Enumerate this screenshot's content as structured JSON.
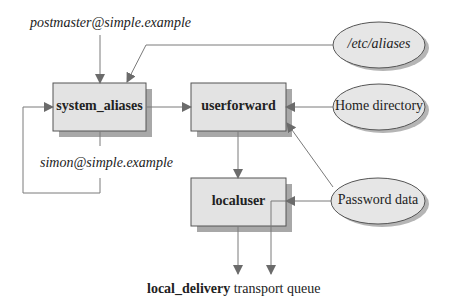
{
  "diagram": {
    "colors": {
      "box_fill": "#e3e3e3",
      "shadow": "#a8a8a8",
      "stroke": "#555555",
      "arrow": "#6b6b6b",
      "line": "#7a7a7a"
    },
    "inputs": {
      "postmaster": "postmaster@simple.example",
      "simon": "simon@simple.example"
    },
    "routers": [
      {
        "id": "system_aliases",
        "label": "system_aliases"
      },
      {
        "id": "userforward",
        "label": "userforward"
      },
      {
        "id": "localuser",
        "label": "localuser"
      }
    ],
    "data_sources": [
      {
        "id": "etc_aliases",
        "label": "/etc/aliases",
        "italic": true
      },
      {
        "id": "home_directory",
        "label": "Home directory",
        "italic": false
      },
      {
        "id": "password_data",
        "label": "Password data",
        "italic": false
      }
    ],
    "output": {
      "transport_name": "local_delivery",
      "suffix": " transport queue"
    }
  }
}
